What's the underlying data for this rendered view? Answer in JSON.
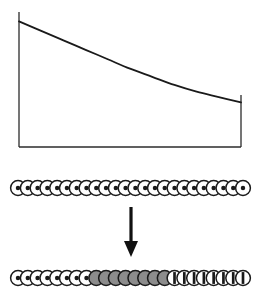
{
  "figure": {
    "title": "",
    "background_color": "#ffffff",
    "line_color": "#1a1a1a",
    "axis_color": "#2b2b2b"
  },
  "chart_data": {
    "type": "line",
    "title": "",
    "xlabel": "",
    "ylabel": "",
    "grid": false,
    "legend": null,
    "xlim": [
      0,
      1
    ],
    "ylim": [
      0,
      1
    ],
    "axis_style": {
      "left_spine": true,
      "bottom_spine": true,
      "right_spine": false,
      "top_spine": false,
      "ticks": false,
      "tick_labels": false,
      "right_end_marker": true
    },
    "x": [
      0.0,
      0.1,
      0.2,
      0.3,
      0.4,
      0.5,
      0.6,
      0.7,
      0.8,
      0.9,
      1.0
    ],
    "series": [
      {
        "name": "decay-curve",
        "color": "#1a1a1a",
        "width": 1.8,
        "values": [
          0.93,
          0.86,
          0.79,
          0.72,
          0.65,
          0.58,
          0.52,
          0.46,
          0.41,
          0.37,
          0.33
        ]
      }
    ]
  },
  "rows": {
    "top": {
      "label": "uniform-bullseye-chain",
      "count": 24,
      "circles": [
        {
          "fill": "bullseye"
        },
        {
          "fill": "bullseye"
        },
        {
          "fill": "bullseye"
        },
        {
          "fill": "bullseye"
        },
        {
          "fill": "bullseye"
        },
        {
          "fill": "bullseye"
        },
        {
          "fill": "bullseye"
        },
        {
          "fill": "bullseye"
        },
        {
          "fill": "bullseye"
        },
        {
          "fill": "bullseye"
        },
        {
          "fill": "bullseye"
        },
        {
          "fill": "bullseye"
        },
        {
          "fill": "bullseye"
        },
        {
          "fill": "bullseye"
        },
        {
          "fill": "bullseye"
        },
        {
          "fill": "bullseye"
        },
        {
          "fill": "bullseye"
        },
        {
          "fill": "bullseye"
        },
        {
          "fill": "bullseye"
        },
        {
          "fill": "bullseye"
        },
        {
          "fill": "bullseye"
        },
        {
          "fill": "bullseye"
        },
        {
          "fill": "bullseye"
        },
        {
          "fill": "bullseye"
        }
      ]
    },
    "bottom": {
      "label": "segmented-chain",
      "count": 24,
      "groups": [
        {
          "name": "bullseye-group",
          "fill": "bullseye",
          "count": 8
        },
        {
          "name": "solid-gray-group",
          "fill": "gray",
          "count": 8
        },
        {
          "name": "barred-group",
          "fill": "barred",
          "count": 8
        }
      ],
      "circles": [
        {
          "fill": "bullseye"
        },
        {
          "fill": "bullseye"
        },
        {
          "fill": "bullseye"
        },
        {
          "fill": "bullseye"
        },
        {
          "fill": "bullseye"
        },
        {
          "fill": "bullseye"
        },
        {
          "fill": "bullseye"
        },
        {
          "fill": "bullseye"
        },
        {
          "fill": "gray"
        },
        {
          "fill": "gray"
        },
        {
          "fill": "gray"
        },
        {
          "fill": "gray"
        },
        {
          "fill": "gray"
        },
        {
          "fill": "gray"
        },
        {
          "fill": "gray"
        },
        {
          "fill": "gray"
        },
        {
          "fill": "barred"
        },
        {
          "fill": "barred"
        },
        {
          "fill": "barred"
        },
        {
          "fill": "barred"
        },
        {
          "fill": "barred"
        },
        {
          "fill": "barred"
        },
        {
          "fill": "barred"
        },
        {
          "fill": "barred"
        }
      ]
    }
  },
  "arrow": {
    "label": "down-arrow",
    "direction": "down",
    "color": "#111111"
  },
  "colors": {
    "circle_outline": "#1a1a1a",
    "circle_white": "#ffffff",
    "circle_core": "#1a1a1a",
    "circle_gray": "#8c8c8c",
    "circle_bar": "#1a1a1a",
    "line": "#1a1a1a",
    "axis": "#2b2b2b"
  }
}
